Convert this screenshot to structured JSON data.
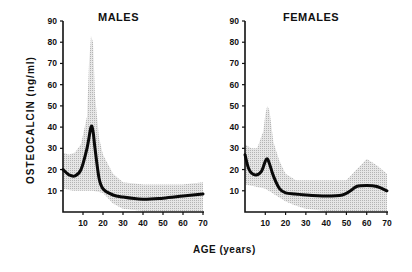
{
  "chart_data": [
    {
      "type": "line",
      "title": "MALES",
      "xlabel": "AGE (years)",
      "ylabel": "OSTEOCALCIN (ng/ml)",
      "xlim": [
        0,
        70
      ],
      "ylim": [
        0,
        90
      ],
      "xticks": [
        10,
        20,
        30,
        40,
        50,
        60,
        70
      ],
      "yticks": [
        10,
        20,
        30,
        40,
        50,
        60,
        70,
        80,
        90
      ],
      "grid": false,
      "series": [
        {
          "name": "mean",
          "x": [
            0,
            3,
            6,
            9,
            12,
            14,
            15,
            16,
            18,
            20,
            25,
            30,
            40,
            50,
            60,
            70
          ],
          "values": [
            20,
            17.5,
            17,
            20,
            30,
            40,
            38,
            30,
            16,
            11,
            8,
            7,
            6,
            6.5,
            7.5,
            8.5
          ]
        },
        {
          "name": "upper range",
          "x": [
            0,
            3,
            6,
            9,
            12,
            13,
            14,
            15,
            16,
            18,
            20,
            25,
            30,
            40,
            50,
            60,
            70
          ],
          "values": [
            28,
            27,
            28,
            32,
            45,
            70,
            83,
            80,
            55,
            35,
            27,
            18,
            14,
            13,
            13,
            13,
            14
          ]
        },
        {
          "name": "lower range",
          "x": [
            0,
            5,
            10,
            15,
            20,
            25,
            30,
            40,
            50,
            60,
            70
          ],
          "values": [
            11,
            10,
            10,
            10,
            9,
            4,
            1.5,
            0.5,
            0.5,
            0.5,
            0.5
          ]
        }
      ]
    },
    {
      "type": "line",
      "title": "FEMALES",
      "xlabel": "AGE (years)",
      "ylabel": "",
      "xlim": [
        0,
        70
      ],
      "ylim": [
        0,
        90
      ],
      "xticks": [
        10,
        20,
        30,
        40,
        50,
        60,
        70
      ],
      "yticks": [
        10,
        20,
        30,
        40,
        50,
        60,
        70,
        80,
        90
      ],
      "grid": false,
      "series": [
        {
          "name": "mean",
          "x": [
            0,
            2,
            5,
            8,
            10,
            11,
            12,
            14,
            17,
            20,
            25,
            30,
            40,
            48,
            52,
            55,
            60,
            65,
            70
          ],
          "values": [
            27,
            20,
            17.5,
            19,
            24,
            25,
            23,
            17,
            11,
            9,
            8.5,
            8,
            7.5,
            8,
            10,
            12,
            12.5,
            12,
            10
          ]
        },
        {
          "name": "upper range",
          "x": [
            0,
            3,
            6,
            9,
            10,
            11,
            12,
            14,
            17,
            20,
            25,
            30,
            40,
            50,
            55,
            60,
            65,
            70
          ],
          "values": [
            32,
            30,
            30,
            38,
            46,
            50,
            48,
            33,
            24,
            18,
            15,
            15,
            15,
            15,
            20,
            25,
            22,
            18
          ]
        },
        {
          "name": "lower range",
          "x": [
            0,
            5,
            10,
            15,
            20,
            25,
            30,
            40,
            50,
            60,
            70
          ],
          "values": [
            13,
            12,
            11,
            8,
            5,
            3,
            1.5,
            0.5,
            0.5,
            0.5,
            0.5
          ]
        }
      ]
    }
  ],
  "labels": {
    "males_title": "MALES",
    "females_title": "FEMALES",
    "y_axis": "OSTEOCALCIN  (ng/ml)",
    "x_axis": "AGE (years)"
  }
}
